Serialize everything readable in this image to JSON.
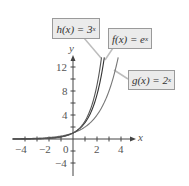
{
  "chart_data": {
    "type": "line",
    "title": "",
    "xlabel": "x",
    "ylabel": "y",
    "xlim": [
      -5,
      5
    ],
    "ylim": [
      -6,
      14
    ],
    "grid": false,
    "x_ticks": [
      -4,
      -2,
      0,
      2,
      4
    ],
    "y_ticks": [
      -4,
      4,
      8,
      12
    ],
    "series": [
      {
        "name": "h(x) = 3^x",
        "label_text": "h(x) = 3",
        "exponent": "x",
        "x": [
          -5,
          -4,
          -3,
          -2,
          -1,
          0,
          1,
          2,
          2.38
        ],
        "values": [
          0.004,
          0.012,
          0.037,
          0.111,
          0.333,
          1,
          3,
          9,
          13.6
        ]
      },
      {
        "name": "f(x) = e^x",
        "label_text": "f(x) = e",
        "exponent": "x",
        "x": [
          -5,
          -4,
          -3,
          -2,
          -1,
          0,
          1,
          2,
          2.61
        ],
        "values": [
          0.007,
          0.018,
          0.05,
          0.135,
          0.368,
          1,
          2.718,
          7.389,
          13.6
        ]
      },
      {
        "name": "g(x) = 2^x",
        "label_text": "g(x) = 2",
        "exponent": "x",
        "x": [
          -5,
          -4,
          -3,
          -2,
          -1,
          0,
          1,
          2,
          3,
          3.77
        ],
        "values": [
          0.031,
          0.063,
          0.125,
          0.25,
          0.5,
          1,
          2,
          4,
          8,
          13.6
        ]
      }
    ],
    "annotations": [
      "h(x) = 3^x",
      "f(x) = e^x",
      "g(x) = 2^x"
    ]
  },
  "labels": {
    "h": {
      "base": "h(x) = 3",
      "exp": "x"
    },
    "f": {
      "base": "f(x) = e",
      "exp": "x"
    },
    "g": {
      "base": "g(x) = 2",
      "exp": "x"
    }
  },
  "axes": {
    "x_label": "x",
    "y_label": "y",
    "x_ticks": [
      "−4",
      "−2",
      "0",
      "2",
      "4"
    ],
    "y_ticks": [
      "12",
      "8",
      "4",
      "−4"
    ]
  }
}
